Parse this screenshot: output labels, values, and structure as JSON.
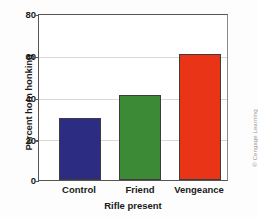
{
  "chart_data": {
    "type": "bar",
    "title": "",
    "subtitle": "",
    "categories": [
      "Control",
      "Friend",
      "Vengeance"
    ],
    "values": [
      30,
      41,
      61
    ],
    "series": [
      {
        "name": "Percent horn honking",
        "values": [
          30,
          41,
          61
        ]
      }
    ],
    "xlabel": "Rifle present",
    "ylabel": "Percent horn honking",
    "ylim": [
      0,
      80
    ],
    "xlim": [
      0,
      3
    ],
    "yticks": [
      0,
      20,
      40,
      60,
      80
    ],
    "ytick_labels": [
      "0",
      "20",
      "40",
      "60",
      "80"
    ],
    "grid": true,
    "grid_axis": "y",
    "legend": false,
    "legend_position": "none",
    "bar_colors": [
      "#2c2c82",
      "#3c8a36",
      "#ea3418"
    ],
    "bar_edge_color": "#3d3d3d",
    "annotations": []
  },
  "axis": {
    "y_title": "Percent horn honking",
    "x_title": "Rifle present",
    "y_ticks": [
      {
        "label": "80",
        "value": 80
      },
      {
        "label": "60",
        "value": 60
      },
      {
        "label": "40",
        "value": 40
      },
      {
        "label": "20",
        "value": 20
      },
      {
        "label": "0",
        "value": 0
      }
    ],
    "x_ticks": [
      {
        "label": "Control"
      },
      {
        "label": "Friend"
      },
      {
        "label": "Vengeance"
      }
    ]
  },
  "credit": {
    "text": "© Cengage Learning"
  },
  "colors": {
    "bar_control": "#2c2c82",
    "bar_friend": "#3c8a36",
    "bar_vengeance": "#ea3418",
    "axis": "#555555",
    "grid": "#d8d8d8",
    "text": "#1a1a1a",
    "background": "#fdfdfd",
    "plot_background": "#ffffff",
    "credit_text": "#9a9a9a"
  }
}
